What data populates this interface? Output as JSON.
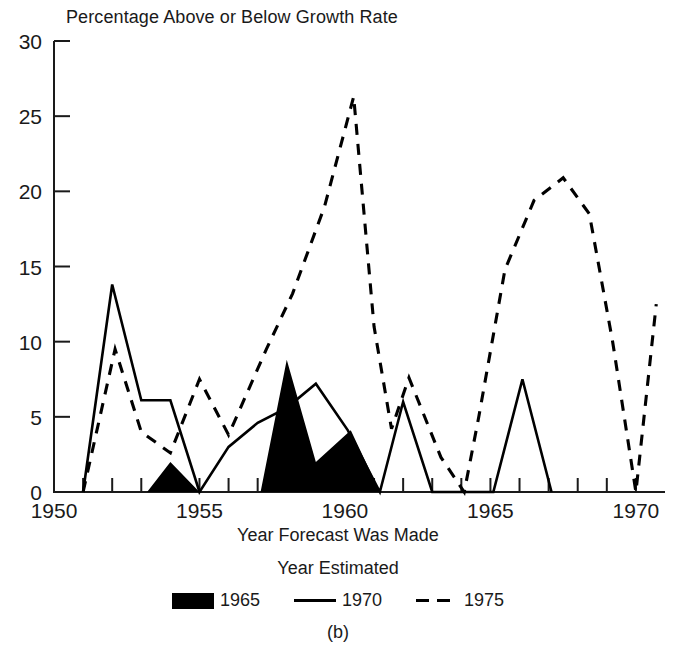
{
  "chart_data": {
    "type": "line",
    "title": "Percentage Above or Below Growth Rate",
    "xlabel": "Year Forecast Was Made",
    "ylabel": "",
    "panel_label": "(b)",
    "legend_title": "Year Estimated",
    "legend_position": "bottom",
    "grid": false,
    "xlim": [
      1950,
      1971
    ],
    "ylim": [
      0,
      30
    ],
    "xticks": [
      1950,
      1951,
      1952,
      1953,
      1954,
      1955,
      1956,
      1957,
      1958,
      1959,
      1960,
      1961,
      1962,
      1963,
      1964,
      1965,
      1966,
      1967,
      1968,
      1969,
      1970
    ],
    "xticklabels": [
      "1950",
      "",
      "",
      "",
      "",
      "1955",
      "",
      "",
      "",
      "",
      "1960",
      "",
      "",
      "",
      "",
      "1965",
      "",
      "",
      "",
      "",
      "1970"
    ],
    "yticks": [
      0,
      5,
      10,
      15,
      20,
      25,
      30
    ],
    "yticklabels": [
      "0",
      "5",
      "10",
      "15",
      "20",
      "25",
      "30"
    ],
    "series": [
      {
        "name": "1965",
        "style": "filled-area",
        "color": "#000000",
        "x": [
          1953.2,
          1954.0,
          1955.0,
          1957.1,
          1958.0,
          1959.0,
          1960.2,
          1961.2
        ],
        "values": [
          0,
          2.0,
          0,
          0,
          8.8,
          2.0,
          4.1,
          0
        ]
      },
      {
        "name": "1970",
        "style": "solid-line",
        "color": "#000000",
        "x": [
          1951.0,
          1952.0,
          1953.0,
          1954.0,
          1955.0,
          1956.0,
          1957.0,
          1958.0,
          1959.0,
          1960.1,
          1961.2,
          1962.0,
          1963.0,
          1965.1,
          1966.1,
          1967.1
        ],
        "values": [
          0,
          13.8,
          6.1,
          6.1,
          0,
          3.0,
          4.6,
          5.6,
          7.2,
          4.1,
          0,
          6.0,
          0,
          0,
          7.5,
          0
        ]
      },
      {
        "name": "1975",
        "style": "dashed-line",
        "color": "#000000",
        "x": [
          1951.0,
          1952.1,
          1953.0,
          1954.0,
          1955.0,
          1956.0,
          1957.3,
          1958.2,
          1959.3,
          1960.3,
          1961.0,
          1961.6,
          1962.2,
          1963.3,
          1964.1,
          1964.6,
          1965.5,
          1966.5,
          1967.5,
          1968.4,
          1969.2,
          1970.0,
          1970.7
        ],
        "values": [
          0,
          9.5,
          4.0,
          2.6,
          7.5,
          3.8,
          9.5,
          13.2,
          19.0,
          26.3,
          11.0,
          4.2,
          7.6,
          2.3,
          0,
          5.0,
          14.8,
          19.4,
          20.9,
          18.5,
          10.0,
          0,
          12.5
        ]
      }
    ]
  },
  "legend": {
    "entries": [
      {
        "label": "1965",
        "marker": "filled-swatch"
      },
      {
        "label": "1970",
        "marker": "solid-line"
      },
      {
        "label": "1975",
        "marker": "dashed-line"
      }
    ]
  }
}
